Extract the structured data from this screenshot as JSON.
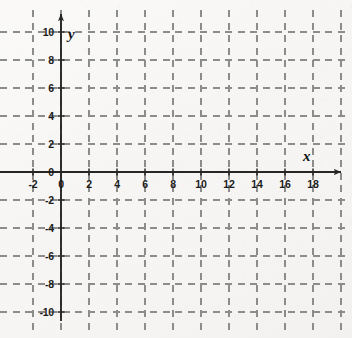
{
  "figure": {
    "kind": "cartesian-coordinate-grid",
    "background_color": "#f6f5f3",
    "axis_color": "#262626",
    "grid_color": "#8c8c8c",
    "label_color": "#1b1b1b"
  },
  "axes": {
    "x_axis_label": "x",
    "y_axis_label": "y",
    "x_arrow": "arrow-right",
    "y_arrow": "arrow-up"
  },
  "chart_data": {
    "type": "scatter",
    "title": "",
    "subtitle": "",
    "xlabel": "x",
    "ylabel": "y",
    "series": [
      {
        "name": "empty",
        "x": [],
        "y": []
      }
    ],
    "xlim": [
      -3,
      20.5
    ],
    "ylim": [
      -11.5,
      11
    ],
    "grid": true,
    "grid_style": "dashed",
    "grid_spacing_x": 2,
    "grid_spacing_y": 2,
    "legend": "none",
    "annotations": [],
    "x_tick_labels": [
      "-2",
      "0",
      "2",
      "4",
      "6",
      "8",
      "10",
      "12",
      "14",
      "16",
      "18"
    ],
    "x_tick_values": [
      -2,
      0,
      2,
      4,
      6,
      8,
      10,
      12,
      14,
      16,
      18
    ],
    "y_tick_labels": [
      "10",
      "8",
      "6",
      "4",
      "2",
      "0",
      "-2",
      "-4",
      "-6",
      "-8",
      "-10"
    ],
    "y_tick_values": [
      10,
      8,
      6,
      4,
      2,
      0,
      -2,
      -4,
      -6,
      -8,
      -10
    ],
    "x_gridline_values": [
      -2,
      0,
      2,
      4,
      6,
      8,
      10,
      12,
      14,
      16,
      18,
      20
    ],
    "y_gridline_values": [
      10,
      8,
      6,
      4,
      2,
      -2,
      -4,
      -6,
      -8,
      -10
    ]
  },
  "geometry": {
    "origin_px": {
      "x": 61,
      "y": 172
    },
    "unit_px": 14,
    "x_axis_start_px": 0,
    "x_axis_end_px": 341,
    "y_axis_top_px": 14,
    "y_axis_bottom_px": 321
  }
}
